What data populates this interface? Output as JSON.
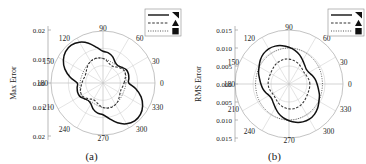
{
  "figure": {
    "background": "#ffffff",
    "panels": [
      {
        "id": "a",
        "caption": "(a)",
        "axis_title": "Max Error",
        "radial_ticks": [
          "0.02",
          "0.01",
          "0.00",
          "0.01",
          "0.02"
        ],
        "angular_ticks": [
          "0",
          "30",
          "60",
          "90",
          "120",
          "150",
          "180",
          "210",
          "240",
          "270",
          "300",
          "330"
        ],
        "legend": [
          {
            "style": "solid",
            "marker": "flag-marker"
          },
          {
            "style": "dashed",
            "marker": "triangle-marker"
          },
          {
            "style": "dotted",
            "marker": "square-marker"
          }
        ]
      },
      {
        "id": "b",
        "caption": "(b)",
        "axis_title": "RMS Error",
        "radial_ticks": [
          "0.015",
          "0.010",
          "0.005",
          "0.000",
          "0.005",
          "0.010",
          "0.015"
        ],
        "angular_ticks": [
          "0",
          "30",
          "60",
          "90",
          "120",
          "150",
          "180",
          "210",
          "240",
          "270",
          "300",
          "330"
        ],
        "legend": [
          {
            "style": "solid",
            "marker": "flag-marker"
          },
          {
            "style": "dashed",
            "marker": "triangle-marker"
          },
          {
            "style": "dotted",
            "marker": "square-marker"
          }
        ]
      }
    ]
  },
  "chart_data": [
    {
      "type": "line",
      "subplot": "a",
      "projection": "polar",
      "title": "",
      "xlabel": "",
      "ylabel": "Max Error",
      "rlim": [
        0,
        0.02
      ],
      "rticks": [
        0.0,
        0.01,
        0.02
      ],
      "thetaticks": [
        0,
        30,
        60,
        90,
        120,
        150,
        180,
        210,
        240,
        270,
        300,
        330
      ],
      "grid": true,
      "legend_position": "upper-right",
      "theta": [
        0,
        10,
        20,
        30,
        40,
        50,
        60,
        70,
        80,
        90,
        100,
        110,
        120,
        130,
        140,
        150,
        160,
        170,
        180,
        190,
        200,
        210,
        220,
        230,
        240,
        250,
        260,
        270,
        280,
        290,
        300,
        310,
        320,
        330,
        340,
        350
      ],
      "series": [
        {
          "name": "solid",
          "marker": "flag-marker",
          "values": [
            0.0099,
            0.0101,
            0.0104,
            0.0103,
            0.0094,
            0.0088,
            0.0093,
            0.0108,
            0.0118,
            0.0122,
            0.0139,
            0.0163,
            0.0181,
            0.019,
            0.0188,
            0.0176,
            0.0156,
            0.0128,
            0.0099,
            0.0101,
            0.0104,
            0.0103,
            0.0094,
            0.0088,
            0.0093,
            0.0108,
            0.0118,
            0.0122,
            0.0139,
            0.0163,
            0.0181,
            0.019,
            0.0188,
            0.0176,
            0.0156,
            0.0128
          ]
        },
        {
          "name": "dashed",
          "marker": "triangle-marker",
          "values": [
            0.0081,
            0.0086,
            0.0092,
            0.0094,
            0.0089,
            0.008,
            0.0074,
            0.0077,
            0.0086,
            0.0094,
            0.0098,
            0.0099,
            0.0096,
            0.009,
            0.0082,
            0.0076,
            0.0074,
            0.0077,
            0.0081,
            0.0086,
            0.0092,
            0.0094,
            0.0089,
            0.008,
            0.0074,
            0.0077,
            0.0086,
            0.0094,
            0.0098,
            0.0099,
            0.0096,
            0.009,
            0.0082,
            0.0076,
            0.0074,
            0.0077
          ]
        },
        {
          "name": "dotted",
          "marker": "square-marker",
          "values": [
            0.0088,
            0.009,
            0.0093,
            0.0095,
            0.0093,
            0.0089,
            0.0086,
            0.0087,
            0.0091,
            0.0095,
            0.0097,
            0.0097,
            0.0095,
            0.0092,
            0.0089,
            0.0087,
            0.0086,
            0.0087,
            0.0088,
            0.009,
            0.0093,
            0.0095,
            0.0093,
            0.0089,
            0.0086,
            0.0087,
            0.0091,
            0.0095,
            0.0097,
            0.0097,
            0.0095,
            0.0092,
            0.0089,
            0.0087,
            0.0086,
            0.0087
          ]
        }
      ]
    },
    {
      "type": "line",
      "subplot": "b",
      "projection": "polar",
      "title": "",
      "xlabel": "",
      "ylabel": "RMS Error",
      "rlim": [
        0,
        0.015
      ],
      "rticks": [
        0.0,
        0.005,
        0.01,
        0.015
      ],
      "thetaticks": [
        0,
        30,
        60,
        90,
        120,
        150,
        180,
        210,
        240,
        270,
        300,
        330
      ],
      "grid": true,
      "legend_position": "upper-right",
      "theta": [
        0,
        10,
        20,
        30,
        40,
        50,
        60,
        70,
        80,
        90,
        100,
        110,
        120,
        130,
        140,
        150,
        160,
        170,
        180,
        190,
        200,
        210,
        220,
        230,
        240,
        250,
        260,
        270,
        280,
        290,
        300,
        310,
        320,
        330,
        340,
        350
      ],
      "series": [
        {
          "name": "solid",
          "marker": "flag-marker",
          "values": [
            0.0078,
            0.0074,
            0.0069,
            0.0064,
            0.0063,
            0.0068,
            0.0076,
            0.0086,
            0.0095,
            0.0102,
            0.0108,
            0.0112,
            0.0113,
            0.011,
            0.0104,
            0.0096,
            0.009,
            0.0083,
            0.0078,
            0.0074,
            0.0069,
            0.0064,
            0.0063,
            0.0068,
            0.0076,
            0.0086,
            0.0095,
            0.0102,
            0.0108,
            0.0112,
            0.0113,
            0.011,
            0.0104,
            0.0096,
            0.009,
            0.0083
          ]
        },
        {
          "name": "dashed",
          "marker": "triangle-marker",
          "values": [
            0.0058,
            0.0057,
            0.0055,
            0.0053,
            0.0053,
            0.0056,
            0.006,
            0.0064,
            0.0067,
            0.0069,
            0.007,
            0.0069,
            0.0067,
            0.0064,
            0.0061,
            0.0059,
            0.0058,
            0.0058,
            0.0058,
            0.0057,
            0.0055,
            0.0053,
            0.0053,
            0.0056,
            0.006,
            0.0064,
            0.0067,
            0.0069,
            0.007,
            0.0069,
            0.0067,
            0.0064,
            0.0061,
            0.0059,
            0.0058,
            0.0058
          ]
        },
        {
          "name": "dotted",
          "marker": "square-marker",
          "values": [
            0.0093,
            0.0093,
            0.0094,
            0.0095,
            0.0096,
            0.0097,
            0.0098,
            0.0099,
            0.01,
            0.01,
            0.01,
            0.0099,
            0.0098,
            0.0097,
            0.0096,
            0.0095,
            0.0094,
            0.0093,
            0.0093,
            0.0093,
            0.0094,
            0.0095,
            0.0096,
            0.0097,
            0.0098,
            0.0099,
            0.01,
            0.01,
            0.01,
            0.0099,
            0.0098,
            0.0097,
            0.0096,
            0.0095,
            0.0094,
            0.0093
          ]
        }
      ]
    }
  ]
}
